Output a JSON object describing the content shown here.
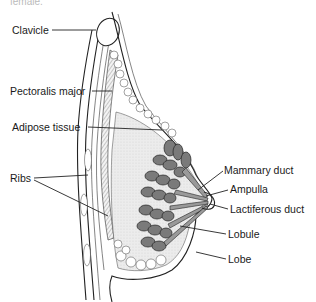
{
  "figure": {
    "caption_fragment": "female.",
    "labels": {
      "clavicle": "Clavicle",
      "pectoralis_major": "Pectoralis major",
      "adipose_tissue": "Adipose tissue",
      "ribs": "Ribs",
      "mammary_duct": "Mammary duct",
      "ampulla": "Ampulla",
      "lactiferous_duct": "Lactiferous duct",
      "lobule": "Lobule",
      "lobe": "Lobe"
    },
    "colors": {
      "line": "#222222",
      "lobule_fill": "#7a7a7a",
      "stroma_fill": "#e6e6e6",
      "background": "#ffffff"
    }
  }
}
